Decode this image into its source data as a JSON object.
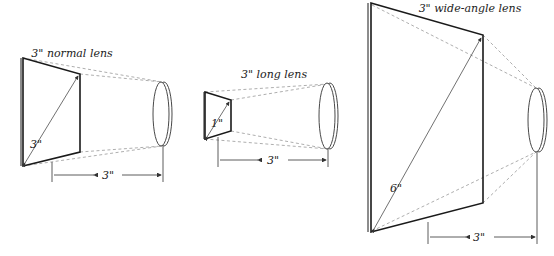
{
  "diagram": {
    "panels": [
      {
        "title": "3\" normal lens",
        "diagonal_label": "3\"",
        "distance_label": "3\""
      },
      {
        "title": "3\" long lens",
        "diagonal_label": "1\"",
        "distance_label": "3\""
      },
      {
        "title": "3\" wide-angle lens",
        "diagonal_label": "6\"",
        "distance_label": "3\""
      }
    ]
  }
}
